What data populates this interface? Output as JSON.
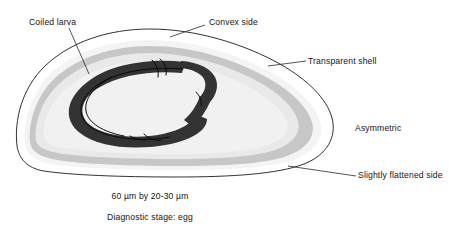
{
  "annotations": [
    {
      "id": "coiled-larva",
      "label": "Coiled larva"
    },
    {
      "id": "convex-side",
      "label": "Convex side"
    },
    {
      "id": "transparent-shell",
      "label": "Transparent shell"
    },
    {
      "id": "asymmetric",
      "label": "Asymmetric"
    },
    {
      "id": "flattened-side",
      "label": "Slightly flattened side"
    }
  ],
  "captions": {
    "size": "60 µm by  20-30 µm",
    "stage": "Diagnostic stage: egg"
  },
  "colors": {
    "background": "#ffffff",
    "outline": "#1b1b1b",
    "shell_outer": "#f2f2f2",
    "shell_band": "#c9c9c9",
    "interior": "#e8e8e8",
    "interior_inner": "#efefef",
    "larva": "#333333",
    "larva_detail": "#000000",
    "text": "#151515",
    "leader_line": "#2a2a2a"
  }
}
